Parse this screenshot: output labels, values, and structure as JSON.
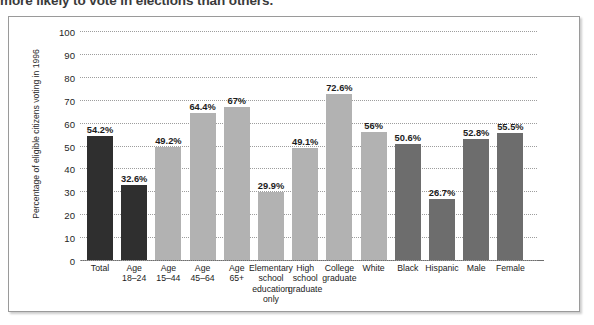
{
  "caption": {
    "clipped_line": "more likely to vote in elections than others."
  },
  "chart_data": {
    "type": "bar",
    "title": "",
    "xlabel": "",
    "ylabel": "Percentage of eligible citizens voting in 1996",
    "ylim": [
      0,
      100
    ],
    "ytick_labels": [
      "100",
      "90",
      "80",
      "70",
      "60",
      "50",
      "40",
      "30",
      "20",
      "10",
      "0"
    ],
    "ytick_values": [
      100,
      90,
      80,
      70,
      60,
      50,
      40,
      30,
      20,
      10,
      0
    ],
    "grid": "horizontal-dotted",
    "legend": "none",
    "categories": [
      "Total",
      "Age 18–24",
      "Age 15–44",
      "Age 45–64",
      "Age 65+",
      "Elementary school education only",
      "High school graduate",
      "College graduate",
      "White",
      "Black",
      "Hispanic",
      "Male",
      "Female"
    ],
    "category_lines": [
      [
        "Total"
      ],
      [
        "Age",
        "18–24"
      ],
      [
        "Age",
        "15–44"
      ],
      [
        "Age",
        "45–64"
      ],
      [
        "Age",
        "65+"
      ],
      [
        "Elementary",
        "school",
        "education",
        "only"
      ],
      [
        "High",
        "school",
        "graduate"
      ],
      [
        "College",
        "graduate"
      ],
      [
        "White"
      ],
      [
        "Black"
      ],
      [
        "Hispanic"
      ],
      [
        "Male"
      ],
      [
        "Female"
      ]
    ],
    "values": [
      54.2,
      32.6,
      49.2,
      64.4,
      67,
      29.9,
      49.1,
      72.6,
      56,
      50.6,
      26.7,
      52.8,
      55.5
    ],
    "value_labels": [
      "54.2%",
      "32.6%",
      "49.2%",
      "64.4%",
      "67%",
      "29.9%",
      "49.1%",
      "72.6%",
      "56%",
      "50.6%",
      "26.7%",
      "52.8%",
      "55.5%"
    ],
    "bar_colors": [
      "#2f2f2f",
      "#2f2f2f",
      "#b2b2b2",
      "#b2b2b2",
      "#b2b2b2",
      "#b2b2b2",
      "#b2b2b2",
      "#b2b2b2",
      "#b2b2b2",
      "#6d6d6d",
      "#6d6d6d",
      "#6d6d6d",
      "#6d6d6d"
    ],
    "color_groups": [
      {
        "name": "overall-and-youth",
        "color": "#2f2f2f"
      },
      {
        "name": "age-and-education",
        "color": "#b2b2b2"
      },
      {
        "name": "race-and-gender",
        "color": "#6d6d6d"
      }
    ]
  }
}
